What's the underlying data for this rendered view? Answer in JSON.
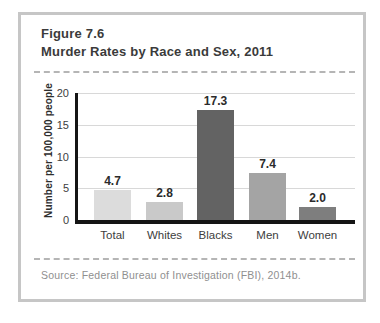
{
  "figure": {
    "label": "Figure 7.6",
    "title": "Murder Rates by Race and Sex, 2011",
    "source": "Source: Federal Bureau of Investigation (FBI), 2014b."
  },
  "chart_data": {
    "type": "bar",
    "categories": [
      "Total",
      "Whites",
      "Blacks",
      "Men",
      "Women"
    ],
    "values": [
      4.7,
      2.8,
      17.3,
      7.4,
      2.0
    ],
    "value_labels": [
      "4.7",
      "2.8",
      "17.3",
      "7.4",
      "2.0"
    ],
    "bar_colors": [
      "#dcdcdc",
      "#c9c9c9",
      "#636363",
      "#a4a4a4",
      "#7e7e7e"
    ],
    "title": "Murder Rates by Race and Sex, 2011",
    "xlabel": "",
    "ylabel": "Number per 100,000 people",
    "yticks": [
      0,
      5,
      10,
      15,
      20
    ],
    "ylim": [
      0,
      20
    ],
    "grid": true,
    "legend": "none"
  },
  "colors": {
    "card_border": "#c6c6c6",
    "dashed_rule": "#b5b5b5",
    "axis": "#151515",
    "gridline": "#d8d8d8",
    "title_text": "#3b3b3b",
    "tick_text": "#3d3d3d",
    "value_label_text": "#2b2b2b",
    "source_text": "#8f8f8f"
  }
}
